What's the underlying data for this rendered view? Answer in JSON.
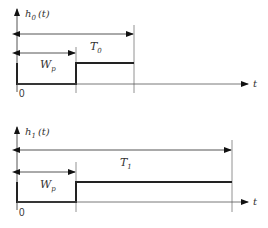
{
  "diagram": {
    "top": {
      "y_label": "h",
      "y_label_sub": "0",
      "y_label_arg": "(t)",
      "period_label": "T",
      "period_sub": "0",
      "width_label": "W",
      "width_sub": "p",
      "x_label": "t",
      "origin_label": "0"
    },
    "bottom": {
      "y_label": "h",
      "y_label_sub": "1",
      "y_label_arg": "(t)",
      "period_label": "T",
      "period_sub": "1",
      "width_label": "W",
      "width_sub": "p",
      "x_label": "t",
      "origin_label": "0"
    },
    "colors": {
      "line": "#222222",
      "thin": "#555555",
      "text": "#333333"
    }
  }
}
